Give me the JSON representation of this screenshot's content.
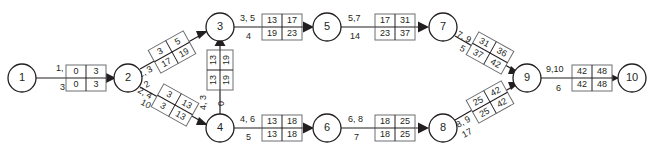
{
  "diagram": {
    "type": "activity-on-arrow-network",
    "title": "",
    "nodes": [
      {
        "id": "1",
        "label": "1",
        "x": 22,
        "y": 78
      },
      {
        "id": "2",
        "label": "2",
        "x": 128,
        "y": 78
      },
      {
        "id": "3",
        "label": "3",
        "x": 220,
        "y": 27
      },
      {
        "id": "4",
        "label": "4",
        "x": 220,
        "y": 128
      },
      {
        "id": "5",
        "label": "5",
        "x": 327,
        "y": 27
      },
      {
        "id": "6",
        "label": "6",
        "x": 327,
        "y": 128
      },
      {
        "id": "7",
        "label": "7",
        "x": 443,
        "y": 27
      },
      {
        "id": "8",
        "label": "8",
        "x": 443,
        "y": 128
      },
      {
        "id": "9",
        "label": "9",
        "x": 527,
        "y": 78
      },
      {
        "id": "10",
        "label": "10",
        "x": 632,
        "y": 78
      }
    ],
    "edges": [
      {
        "id": "e1",
        "from": "1",
        "to": "2",
        "activity_label": "1, 2",
        "duration_label": "3",
        "box": {
          "es": "0",
          "ef": "3",
          "ls": "0",
          "lf": "3"
        },
        "orientation": "horizontal"
      },
      {
        "id": "e2",
        "from": "2",
        "to": "3",
        "activity_label": "2, 3",
        "duration_label": "2",
        "box": {
          "es": "3",
          "ef": "5",
          "ls": "17",
          "lf": "19"
        },
        "orientation": "diagonal-up"
      },
      {
        "id": "e3",
        "from": "2",
        "to": "4",
        "activity_label": "2, 4",
        "duration_label": "10",
        "box": {
          "es": "3",
          "ef": "13",
          "ls": "3",
          "lf": "13"
        },
        "orientation": "diagonal-down"
      },
      {
        "id": "e4",
        "from": "4",
        "to": "3",
        "activity_label": "4, 3",
        "duration_label": "0",
        "box": {
          "es": "13",
          "ef": "13",
          "ls": "19",
          "lf": "19"
        },
        "orientation": "vertical"
      },
      {
        "id": "e5",
        "from": "3",
        "to": "5",
        "activity_label": "3, 5",
        "duration_label": "4",
        "box": {
          "es": "13",
          "ef": "17",
          "ls": "19",
          "lf": "23"
        },
        "orientation": "horizontal"
      },
      {
        "id": "e6",
        "from": "5",
        "to": "7",
        "activity_label": "5,7",
        "duration_label": "14",
        "box": {
          "es": "17",
          "ef": "31",
          "ls": "23",
          "lf": "37"
        },
        "orientation": "horizontal"
      },
      {
        "id": "e7",
        "from": "7",
        "to": "9",
        "activity_label": "7, 9",
        "duration_label": "5",
        "box": {
          "es": "31",
          "ef": "36",
          "ls": "37",
          "lf": "42"
        },
        "orientation": "diagonal-down"
      },
      {
        "id": "e8",
        "from": "4",
        "to": "6",
        "activity_label": "4, 6",
        "duration_label": "5",
        "box": {
          "es": "13",
          "ef": "18",
          "ls": "13",
          "lf": "18"
        },
        "orientation": "horizontal"
      },
      {
        "id": "e9",
        "from": "6",
        "to": "8",
        "activity_label": "6, 8",
        "duration_label": "7",
        "box": {
          "es": "18",
          "ef": "25",
          "ls": "18",
          "lf": "25"
        },
        "orientation": "horizontal"
      },
      {
        "id": "e10",
        "from": "8",
        "to": "9",
        "activity_label": "8, 9",
        "duration_label": "17",
        "box": {
          "es": "25",
          "ef": "42",
          "ls": "25",
          "lf": "42"
        },
        "orientation": "diagonal-up"
      },
      {
        "id": "e11",
        "from": "9",
        "to": "10",
        "activity_label": "9,10",
        "duration_label": "6",
        "box": {
          "es": "42",
          "ef": "48",
          "ls": "42",
          "lf": "48"
        },
        "orientation": "horizontal"
      }
    ],
    "colors": {
      "ink": "#231f20",
      "box_border": "#6d6e71",
      "background": "#ffffff"
    }
  }
}
